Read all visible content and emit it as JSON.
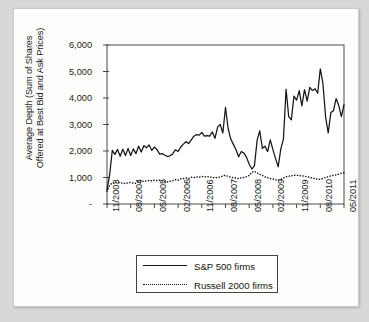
{
  "figure": {
    "background_color": "#d8d8d6",
    "card_color": "#fdfdfc",
    "ink_color": "#15150f"
  },
  "chart_data": {
    "type": "line",
    "title": "",
    "xlabel": "",
    "ylabel": "Average Depth (Sum of Shares\nOffered at Best Bid and Ask Prices)",
    "ylim": [
      0,
      6000
    ],
    "ytick_values": [
      0,
      1000,
      2000,
      3000,
      4000,
      5000,
      6000
    ],
    "ytick_labels": [
      "-",
      "1,000",
      "2,000",
      "3,000",
      "4,000",
      "5,000",
      "6,000"
    ],
    "grid": false,
    "legend_position": "below-axes",
    "x_tick_labels": [
      "11/2003",
      "08/2004",
      "05/2005",
      "02/2006",
      "11/2006",
      "08/2007",
      "05/2008",
      "02/2009",
      "11/2009",
      "08/2010",
      "05/2011"
    ],
    "x_tick_indices": [
      0,
      9,
      18,
      27,
      36,
      45,
      54,
      63,
      72,
      81,
      90
    ],
    "x": [
      "11/2003",
      "12/2003",
      "01/2004",
      "02/2004",
      "03/2004",
      "04/2004",
      "05/2004",
      "06/2004",
      "07/2004",
      "08/2004",
      "09/2004",
      "10/2004",
      "11/2004",
      "12/2004",
      "01/2005",
      "02/2005",
      "03/2005",
      "04/2005",
      "05/2005",
      "06/2005",
      "07/2005",
      "08/2005",
      "09/2005",
      "10/2005",
      "11/2005",
      "12/2005",
      "01/2006",
      "02/2006",
      "03/2006",
      "04/2006",
      "05/2006",
      "06/2006",
      "07/2006",
      "08/2006",
      "09/2006",
      "10/2006",
      "11/2006",
      "12/2006",
      "01/2007",
      "02/2007",
      "03/2007",
      "04/2007",
      "05/2007",
      "06/2007",
      "07/2007",
      "08/2007",
      "09/2007",
      "10/2007",
      "11/2007",
      "12/2007",
      "01/2008",
      "02/2008",
      "03/2008",
      "04/2008",
      "05/2008",
      "06/2008",
      "07/2008",
      "08/2008",
      "09/2008",
      "10/2008",
      "11/2008",
      "12/2008",
      "01/2009",
      "02/2009",
      "03/2009",
      "04/2009",
      "05/2009",
      "06/2009",
      "07/2009",
      "08/2009",
      "09/2009",
      "10/2009",
      "11/2009",
      "12/2009",
      "01/2010",
      "02/2010",
      "03/2010",
      "04/2010",
      "05/2010",
      "06/2010",
      "07/2010",
      "08/2010",
      "09/2010",
      "10/2010",
      "11/2010",
      "12/2010",
      "01/2011",
      "02/2011",
      "03/2011",
      "04/2011",
      "05/2011"
    ],
    "series": [
      {
        "name": "S&P 500 firms",
        "style": "solid",
        "color": "#15150f",
        "values": [
          520,
          1100,
          2020,
          1870,
          2060,
          1800,
          2070,
          1830,
          2100,
          1830,
          2080,
          1900,
          2180,
          1960,
          2200,
          2120,
          2230,
          2020,
          2150,
          2050,
          1880,
          1900,
          1840,
          1790,
          1820,
          1900,
          2050,
          1980,
          2150,
          2260,
          2350,
          2280,
          2420,
          2560,
          2620,
          2600,
          2700,
          2560,
          2580,
          2560,
          2720,
          2480,
          2900,
          3000,
          2680,
          3650,
          2850,
          2450,
          2250,
          2050,
          1780,
          1980,
          1920,
          1760,
          1500,
          1320,
          1450,
          2400,
          2760,
          2100,
          2180,
          1980,
          2420,
          2050,
          1720,
          1400,
          2080,
          2450,
          4330,
          3300,
          3180,
          4070,
          3920,
          4280,
          3700,
          4320,
          3880,
          4400,
          4280,
          4350,
          4180,
          5100,
          4550,
          3300,
          2680,
          3450,
          3520,
          3980,
          3720,
          3300,
          3750
        ]
      },
      {
        "name": "Russell 2000 firms",
        "style": "dotted",
        "color": "#15150f",
        "values": [
          480,
          700,
          800,
          790,
          820,
          800,
          790,
          770,
          800,
          810,
          790,
          780,
          840,
          820,
          870,
          860,
          890,
          870,
          900,
          880,
          900,
          880,
          840,
          830,
          860,
          880,
          920,
          900,
          950,
          960,
          980,
          960,
          1010,
          1000,
          1020,
          1010,
          1040,
          1020,
          1030,
          1020,
          1000,
          990,
          1000,
          1020,
          1060,
          1080,
          1040,
          1010,
          1000,
          980,
          960,
          990,
          1000,
          1030,
          1080,
          1200,
          1230,
          1170,
          1120,
          1080,
          1020,
          990,
          960,
          940,
          910,
          900,
          930,
          980,
          1030,
          1050,
          1060,
          1080,
          1090,
          1070,
          1060,
          1050,
          1030,
          1010,
          980,
          950,
          940,
          930,
          960,
          1000,
          1030,
          1060,
          1080,
          1100,
          1130,
          1160,
          1180
        ]
      }
    ]
  },
  "legend": {
    "entries": [
      {
        "label": "S&P 500 firms",
        "style": "solid"
      },
      {
        "label": "Russell 2000 firms",
        "style": "dotted"
      }
    ]
  }
}
